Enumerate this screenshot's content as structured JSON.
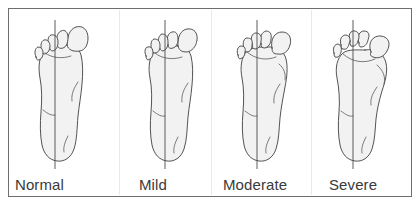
{
  "figure": {
    "type": "medical-illustration",
    "view": "plantar view of right foot",
    "frame_color": "#6e6e6e",
    "background_color": "#ffffff",
    "foot_fill_color": "#f2f2f2",
    "outline_color": "#3f3f3f",
    "axis_line_color": "#4a4a4a",
    "label_color": "#3a3a3a",
    "panel_count": 4
  },
  "panels": [
    {
      "id": "normal",
      "label": "Normal",
      "label_left": 14,
      "panel_left": 14,
      "axis_x": 40,
      "deviation_deg": 0,
      "bunion_prominence": 0,
      "description": "Great toe aligned with first metatarsal; no lateral deviation",
      "toe_angles": [
        0,
        -4,
        -8,
        -13,
        -19
      ],
      "big_toe_tilt": 0
    },
    {
      "id": "mild",
      "label": "Mild",
      "label_left": 138,
      "panel_left": 110,
      "axis_x": 40,
      "deviation_deg": 15,
      "bunion_prominence": 1,
      "description": "Slight lateral deviation of the great toe",
      "toe_angles": [
        8,
        -2,
        -7,
        -12,
        -18
      ],
      "big_toe_tilt": 8
    },
    {
      "id": "moderate",
      "label": "Moderate",
      "label_left": 222,
      "panel_left": 208,
      "axis_x": 40,
      "deviation_deg": 28,
      "bunion_prominence": 2,
      "description": "Marked lateral deviation with prominent medial eminence",
      "toe_angles": [
        22,
        2,
        -5,
        -11,
        -17
      ],
      "big_toe_tilt": 22
    },
    {
      "id": "severe",
      "label": "Severe",
      "label_left": 328,
      "panel_left": 304,
      "axis_x": 40,
      "deviation_deg": 42,
      "bunion_prominence": 3,
      "description": "Severe deviation; great toe crowds or underlaps lesser toes",
      "toe_angles": [
        40,
        10,
        0,
        -8,
        -15
      ],
      "big_toe_tilt": 40
    }
  ],
  "dividers": [
    {
      "id": "divider-1",
      "x": 119
    },
    {
      "id": "divider-2",
      "x": 211
    },
    {
      "id": "divider-3",
      "x": 311
    }
  ]
}
